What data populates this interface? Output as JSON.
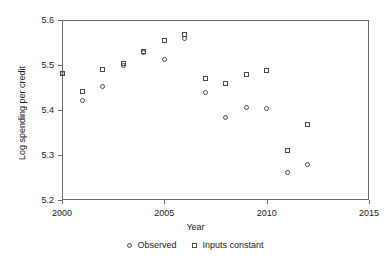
{
  "chart_data": {
    "type": "scatter",
    "title": "",
    "xlabel": "Year",
    "ylabel": "Log spending per credit",
    "xlim": [
      2000,
      2015
    ],
    "ylim": [
      5.2,
      5.6
    ],
    "xticks": [
      2000,
      2005,
      2010,
      2015
    ],
    "yticks": [
      "5.2",
      "5.3",
      "5.4",
      "5.5",
      "5.6"
    ],
    "xtick_labels": [
      "2000",
      "2005",
      "2010",
      "2015"
    ],
    "grid": false,
    "legend_position": "bottom-center",
    "x": [
      2000,
      2001,
      2002,
      2003,
      2004,
      2005,
      2006,
      2007,
      2008,
      2009,
      2010,
      2011,
      2012
    ],
    "series": [
      {
        "name": "Observed",
        "marker": "circle",
        "values": [
          5.482,
          5.422,
          5.452,
          5.499,
          5.527,
          5.512,
          5.558,
          5.439,
          5.384,
          5.405,
          5.403,
          5.262,
          5.279
        ]
      },
      {
        "name": "Inputs constant",
        "marker": "square",
        "values": [
          5.482,
          5.441,
          5.49,
          5.503,
          5.53,
          5.555,
          5.567,
          5.47,
          5.458,
          5.479,
          5.487,
          5.31,
          5.367
        ]
      }
    ]
  },
  "legend": {
    "entries": [
      {
        "label": "Observed",
        "marker": "circle"
      },
      {
        "label": "Inputs constant",
        "marker": "square"
      }
    ]
  },
  "colors": {
    "axis": "#6b6b6b",
    "marker": "#4a4a4a",
    "text": "#1a1a1a",
    "background": "#ffffff"
  }
}
